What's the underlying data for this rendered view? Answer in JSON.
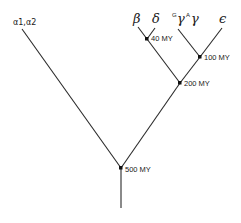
{
  "diagram": {
    "type": "phylogenetic-tree",
    "title": "",
    "leaves": {
      "alpha": {
        "label": "α1,α2"
      },
      "beta": {
        "label": "β"
      },
      "delta": {
        "label": "δ"
      },
      "g_gamma": {
        "sup": "G",
        "label": "γ"
      },
      "a_gamma": {
        "sup": "A",
        "label": "γ"
      },
      "epsilon": {
        "label": "ϵ"
      }
    },
    "nodes": {
      "n40": {
        "label": "40 MY",
        "children": [
          "beta",
          "delta"
        ]
      },
      "n100": {
        "label": "100 MY",
        "children": [
          "g_gamma",
          "a_gamma",
          "epsilon"
        ]
      },
      "n200": {
        "label": "200 MY",
        "children": [
          "n40",
          "n100"
        ]
      },
      "n500": {
        "label": "500 MY",
        "children": [
          "alpha",
          "n200"
        ]
      }
    }
  }
}
